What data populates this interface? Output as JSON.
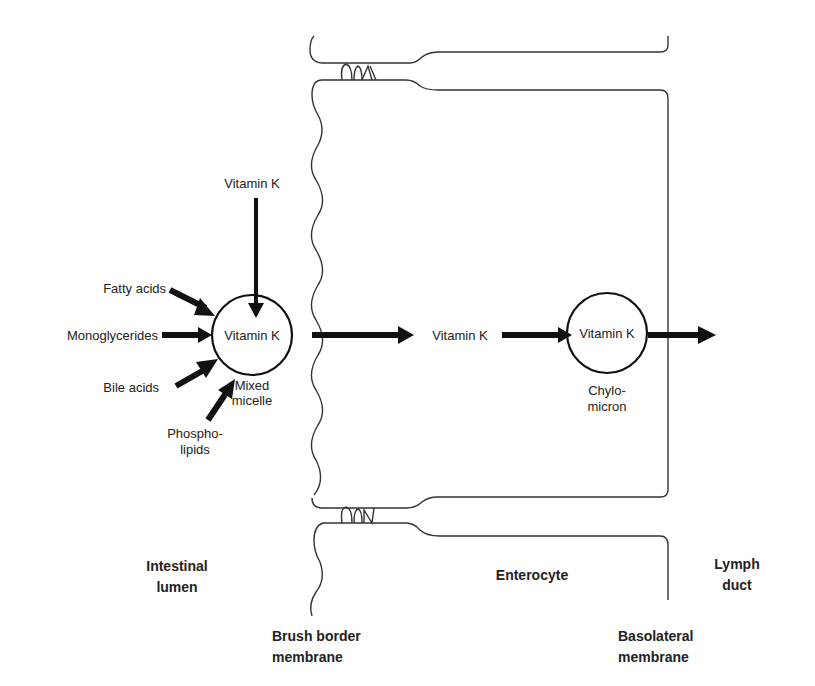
{
  "diagram": {
    "lumen_inputs": {
      "vitamin_k_top": "Vitamin K",
      "fatty_acids": "Fatty acids",
      "monoglycerides": "Monoglycerides",
      "bile_acids": "Bile acids",
      "phospholipids_line1": "Phospho-",
      "phospholipids_line2": "lipids"
    },
    "mixed_micelle": {
      "content": "Vitamin K",
      "label_line1": "Mixed",
      "label_line2": "micelle"
    },
    "enterocyte_vitamin_k": "Vitamin K",
    "chylomicron": {
      "content": "Vitamin K",
      "label_line1": "Chylo-",
      "label_line2": "micron"
    },
    "regions": {
      "lumen_line1": "Intestinal",
      "lumen_line2": "lumen",
      "enterocyte": "Enterocyte",
      "lymph_line1": "Lymph",
      "lymph_line2": "duct"
    },
    "membranes": {
      "brush_border_line1": "Brush border",
      "brush_border_line2": "membrane",
      "basolateral_line1": "Basolateral",
      "basolateral_line2": "membrane"
    }
  }
}
